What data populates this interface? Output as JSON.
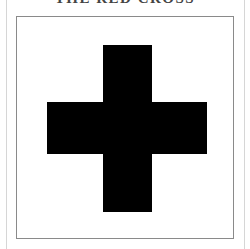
{
  "document": {
    "title": "THE RED CROSS",
    "title_clipped": true
  },
  "figure": {
    "symbol": "cross-icon",
    "symbol_color": "#000000",
    "frame_color": "#8a8a8a",
    "background_color": "#ffffff"
  }
}
